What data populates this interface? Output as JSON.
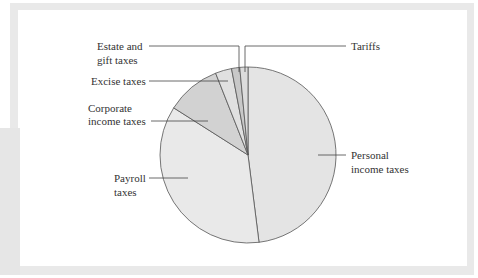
{
  "chart_data": {
    "type": "pie",
    "title": "",
    "categories": [
      "Personal income taxes",
      "Payroll taxes",
      "Corporate income taxes",
      "Excise taxes",
      "Estate and gift taxes",
      "Tariffs"
    ],
    "values": [
      48,
      36,
      10,
      3,
      1.5,
      1.5
    ],
    "unit": "percent of federal revenue (estimated from slice angles)",
    "start_angle": "12 o'clock, clockwise",
    "legend": "none (leader-line labels)"
  },
  "labels": {
    "personal_1": "Personal",
    "personal_2": "income taxes",
    "payroll_1": "Payroll",
    "payroll_2": "taxes",
    "corporate_1": "Corporate",
    "corporate_2": "income taxes",
    "excise": "Excise taxes",
    "estate_1": "Estate and",
    "estate_2": "gift taxes",
    "tariffs": "Tariffs"
  },
  "colors": {
    "personal": "#e4e4e4",
    "payroll": "#e9e9e9",
    "corporate": "#d2d2d2",
    "excise": "#e0e0e0",
    "estate": "#c8c8c8",
    "tariffs": "#dcdcdc",
    "outline": "#555555",
    "frame": "#e9e9e9"
  }
}
